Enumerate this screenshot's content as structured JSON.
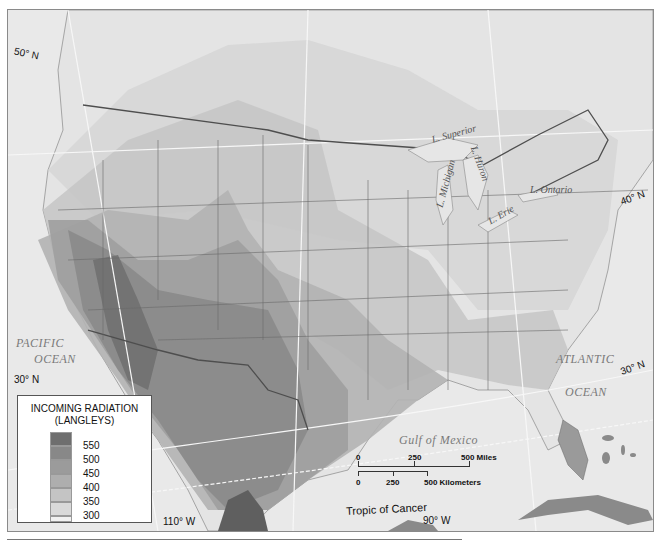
{
  "map": {
    "title": "Incoming Solar Radiation over North America",
    "latitude_labels": [
      "50° N",
      "40° N",
      "30° N",
      "30° N"
    ],
    "longitude_labels": [
      "110° W",
      "90° W"
    ],
    "oceans": {
      "pacific_line1": "PACIFIC",
      "pacific_line2": "OCEAN",
      "atlantic_line1": "ATLANTIC",
      "atlantic_line2": "OCEAN",
      "gulf": "Gulf   of   Mexico"
    },
    "lakes": {
      "superior": "L. Superior",
      "michigan": "L. Michigan",
      "huron": "L. Huron",
      "erie": "L. Erie",
      "ontario": "L. Ontario"
    },
    "tropic_label": "Tropic   of   Cancer",
    "colors": {
      "ocean": "#e8e8e8",
      "land": "#dcdcdc",
      "border": "#5a5a5a",
      "gridline": "#f8f8f8"
    }
  },
  "legend": {
    "title_line1": "INCOMING RADIATION",
    "title_line2": "(LANGLEYS)",
    "entries": [
      {
        "value": "550",
        "color": "#6e6e6e"
      },
      {
        "value": "500",
        "color": "#888888"
      },
      {
        "value": "450",
        "color": "#9b9b9b"
      },
      {
        "value": "400",
        "color": "#aeaeae"
      },
      {
        "value": "350",
        "color": "#c4c4c4"
      },
      {
        "value": "300",
        "color": "#d9d9d9"
      },
      {
        "value": "",
        "color": "#f1f1f1"
      }
    ]
  },
  "scale_bar": {
    "miles": {
      "ticks": [
        "0",
        "250",
        "500 Miles"
      ]
    },
    "kilometers": {
      "ticks": [
        "0",
        "250",
        "500 Kilometers"
      ]
    }
  }
}
